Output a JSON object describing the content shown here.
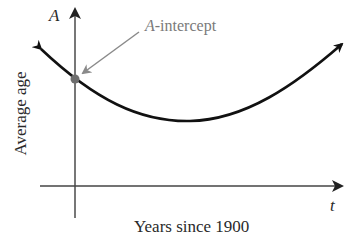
{
  "diagram": {
    "axes": {
      "y_symbol": "A",
      "x_symbol": "t",
      "y_label": "Average age",
      "x_label": "Years since 1900"
    },
    "annotation": {
      "symbol": "A",
      "suffix": "-intercept"
    },
    "colors": {
      "curve": "#111111",
      "axis": "#555555",
      "callout": "#8a8a8a",
      "point": "#6e6e6e"
    }
  }
}
